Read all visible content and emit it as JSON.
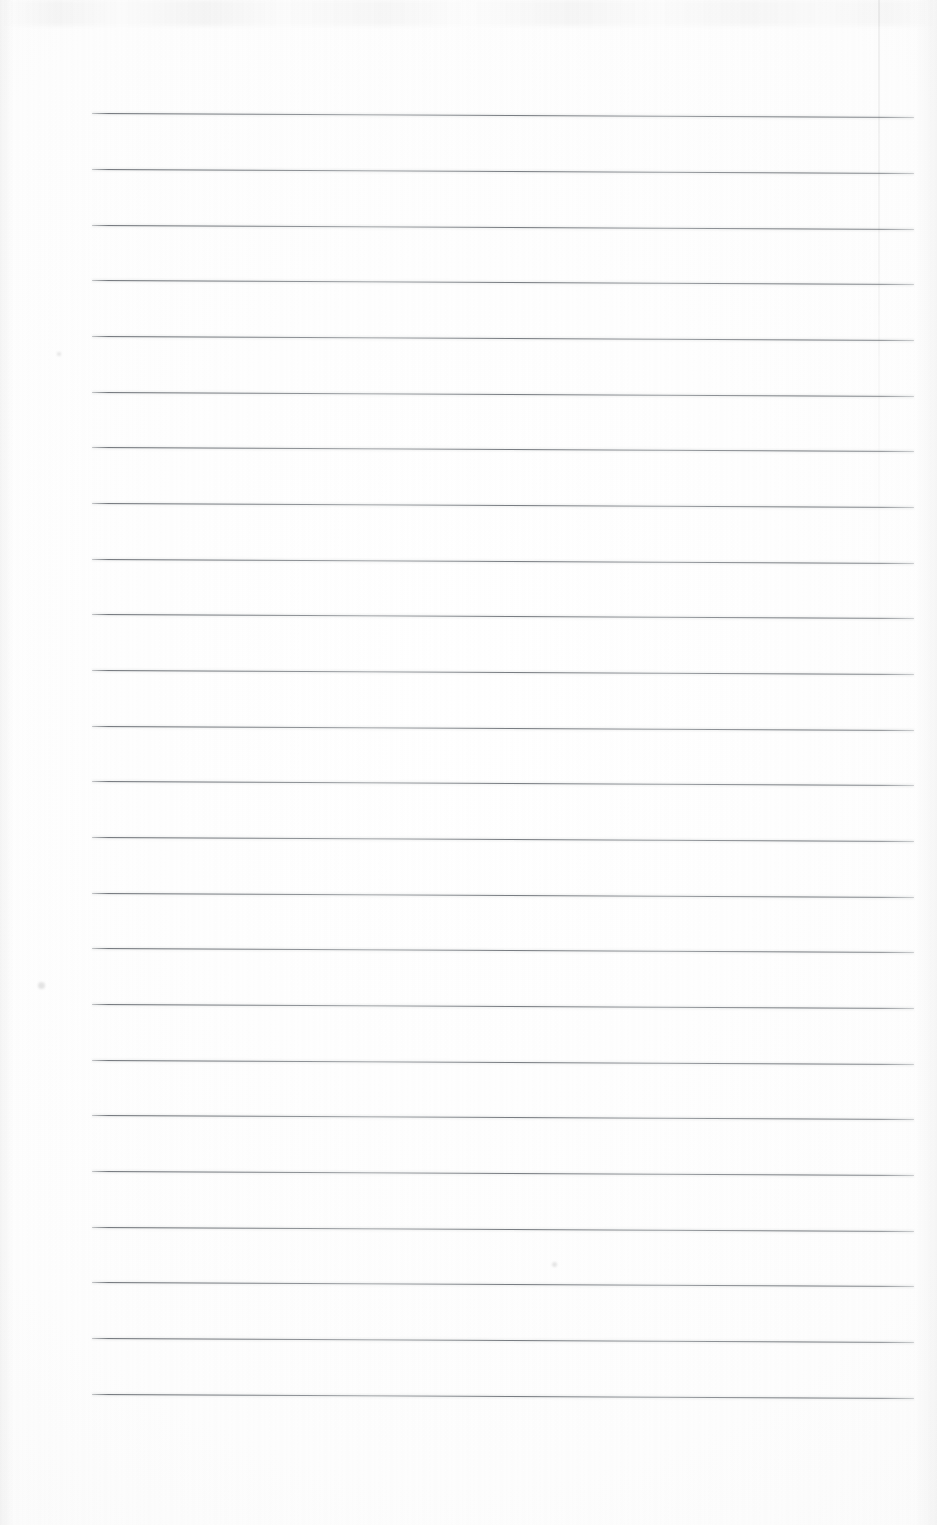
{
  "document": {
    "type": "scanned-lined-page",
    "title": "Blank Ruled Notebook Page",
    "description": "A scanned blank ruled writing page with evenly spaced horizontal lines and no handwriting or printed text.",
    "visible_text": "",
    "page_width": 937,
    "page_height": 1525,
    "background_color": "#fefefe",
    "rule_color": "#5a5e65"
  },
  "ruling": {
    "line_count": 24,
    "first_line_y": 113,
    "line_spacing": 55.7,
    "line_left_x": 92,
    "line_right_x": 914,
    "line_thickness": 1,
    "tilt_degrees": 0.28,
    "lines": [
      {
        "index": 1,
        "y": 113
      },
      {
        "index": 2,
        "y": 169
      },
      {
        "index": 3,
        "y": 225
      },
      {
        "index": 4,
        "y": 280
      },
      {
        "index": 5,
        "y": 336
      },
      {
        "index": 6,
        "y": 392
      },
      {
        "index": 7,
        "y": 447
      },
      {
        "index": 8,
        "y": 503
      },
      {
        "index": 9,
        "y": 559
      },
      {
        "index": 10,
        "y": 614
      },
      {
        "index": 11,
        "y": 670
      },
      {
        "index": 12,
        "y": 726
      },
      {
        "index": 13,
        "y": 781
      },
      {
        "index": 14,
        "y": 837
      },
      {
        "index": 15,
        "y": 893
      },
      {
        "index": 16,
        "y": 948
      },
      {
        "index": 17,
        "y": 1004
      },
      {
        "index": 18,
        "y": 1060
      },
      {
        "index": 19,
        "y": 1115
      },
      {
        "index": 20,
        "y": 1171
      },
      {
        "index": 21,
        "y": 1227
      },
      {
        "index": 22,
        "y": 1282
      },
      {
        "index": 23,
        "y": 1338
      },
      {
        "index": 24,
        "y": 1394
      }
    ]
  },
  "margins": {
    "top_blank_height": 113,
    "bottom_blank_height": 122,
    "left_blank_width": 92,
    "right_blank_width": 23
  },
  "artifacts": {
    "sheet_edge": {
      "x": 878,
      "top": 0,
      "height": 760
    },
    "specks": [
      {
        "x": 38,
        "y": 982,
        "size": 7
      },
      {
        "x": 552,
        "y": 1262,
        "size": 5
      },
      {
        "x": 57,
        "y": 352,
        "size": 4
      }
    ]
  }
}
